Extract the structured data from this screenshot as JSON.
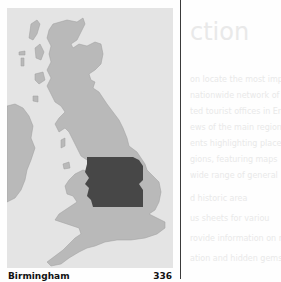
{
  "map": {
    "land_color": "#b9b9b9",
    "sea_color": "#e4e4e4",
    "highlight_color": "#474747",
    "highlight_region": "Birmingham"
  },
  "footer": {
    "city": "Birmingham",
    "page_number": "336"
  },
  "show_through": {
    "heading": "ction",
    "lines": [
      "on locate the most important c",
      "nationwide network of informat",
      "ted tourist ofﬁces in England",
      "ews of the main regional attract",
      "ents highlighting places of interes",
      "gions, featuring maps",
      "wide range of general",
      "d historic area",
      "us sheets for variou",
      "rovide information on regio",
      "ation and hidden gems"
    ]
  }
}
